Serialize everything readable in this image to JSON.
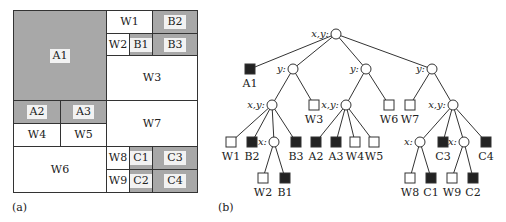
{
  "panel_a": {
    "caption": "(a)",
    "cells": [
      {
        "id": "A1",
        "label": "A1",
        "filled": true,
        "x": 13,
        "y": 10,
        "w": 94,
        "h": 91
      },
      {
        "id": "W1",
        "label": "W1",
        "filled": false,
        "x": 106,
        "y": 10,
        "w": 47,
        "h": 24
      },
      {
        "id": "B2",
        "label": "B2",
        "filled": true,
        "x": 152,
        "y": 10,
        "w": 46,
        "h": 24
      },
      {
        "id": "W2",
        "label": "W2",
        "filled": false,
        "x": 106,
        "y": 33,
        "w": 24,
        "h": 23
      },
      {
        "id": "B1",
        "label": "B1",
        "filled": true,
        "x": 129,
        "y": 33,
        "w": 24,
        "h": 23
      },
      {
        "id": "B3",
        "label": "B3",
        "filled": true,
        "x": 152,
        "y": 33,
        "w": 46,
        "h": 23
      },
      {
        "id": "W3",
        "label": "W3",
        "filled": false,
        "x": 106,
        "y": 55,
        "w": 92,
        "h": 46
      },
      {
        "id": "A2",
        "label": "A2",
        "filled": true,
        "x": 13,
        "y": 100,
        "w": 48,
        "h": 24
      },
      {
        "id": "A3",
        "label": "A3",
        "filled": true,
        "x": 60,
        "y": 100,
        "w": 47,
        "h": 24
      },
      {
        "id": "W4",
        "label": "W4",
        "filled": false,
        "x": 13,
        "y": 123,
        "w": 48,
        "h": 24
      },
      {
        "id": "W5",
        "label": "W5",
        "filled": false,
        "x": 60,
        "y": 123,
        "w": 47,
        "h": 24
      },
      {
        "id": "W7",
        "label": "W7",
        "filled": false,
        "x": 106,
        "y": 100,
        "w": 92,
        "h": 47
      },
      {
        "id": "W6",
        "label": "W6",
        "filled": false,
        "x": 13,
        "y": 146,
        "w": 94,
        "h": 47
      },
      {
        "id": "W8",
        "label": "W8",
        "filled": false,
        "x": 106,
        "y": 146,
        "w": 24,
        "h": 24
      },
      {
        "id": "C1",
        "label": "C1",
        "filled": true,
        "x": 129,
        "y": 146,
        "w": 24,
        "h": 24
      },
      {
        "id": "C3",
        "label": "C3",
        "filled": true,
        "x": 152,
        "y": 146,
        "w": 46,
        "h": 24
      },
      {
        "id": "W9",
        "label": "W9",
        "filled": false,
        "x": 106,
        "y": 169,
        "w": 24,
        "h": 24
      },
      {
        "id": "C2",
        "label": "C2",
        "filled": true,
        "x": 129,
        "y": 169,
        "w": 24,
        "h": 24
      },
      {
        "id": "C4",
        "label": "C4",
        "filled": true,
        "x": 152,
        "y": 169,
        "w": 46,
        "h": 24
      }
    ]
  },
  "panel_b": {
    "caption": "(b)",
    "nodes": [
      {
        "id": "root",
        "kind": "split",
        "label": "x,y:",
        "x": 126,
        "y": 34
      },
      {
        "id": "A1",
        "kind": "filled",
        "label": "A1",
        "x": 40,
        "y": 69
      },
      {
        "id": "y1",
        "kind": "split",
        "label": "y:",
        "x": 83,
        "y": 69
      },
      {
        "id": "y2",
        "kind": "split",
        "label": "y:",
        "x": 156,
        "y": 69
      },
      {
        "id": "y3",
        "kind": "split",
        "label": "y:",
        "x": 222,
        "y": 69
      },
      {
        "id": "xy1",
        "kind": "split",
        "label": "x,y:",
        "x": 62,
        "y": 105
      },
      {
        "id": "W3",
        "kind": "empty",
        "label": "W3",
        "x": 104,
        "y": 105
      },
      {
        "id": "xy2",
        "kind": "split",
        "label": "x,y:",
        "x": 136,
        "y": 105
      },
      {
        "id": "W6",
        "kind": "empty",
        "label": "W6",
        "x": 179,
        "y": 105
      },
      {
        "id": "W7",
        "kind": "empty",
        "label": "W7",
        "x": 200,
        "y": 105
      },
      {
        "id": "xy3",
        "kind": "split",
        "label": "x,y:",
        "x": 243,
        "y": 105
      },
      {
        "id": "W1",
        "kind": "empty",
        "label": "W1",
        "x": 21,
        "y": 142
      },
      {
        "id": "B2",
        "kind": "filled",
        "label": "B2",
        "x": 42,
        "y": 142
      },
      {
        "id": "x1",
        "kind": "split",
        "label": "x:",
        "x": 64,
        "y": 142
      },
      {
        "id": "B3",
        "kind": "filled",
        "label": "B3",
        "x": 86,
        "y": 142
      },
      {
        "id": "A2",
        "kind": "filled",
        "label": "A2",
        "x": 106,
        "y": 142
      },
      {
        "id": "A3",
        "kind": "filled",
        "label": "A3",
        "x": 126,
        "y": 142
      },
      {
        "id": "W4",
        "kind": "empty",
        "label": "W4",
        "x": 145,
        "y": 142
      },
      {
        "id": "W5",
        "kind": "empty",
        "label": "W5",
        "x": 164,
        "y": 142
      },
      {
        "id": "x2",
        "kind": "split",
        "label": "x:",
        "x": 210,
        "y": 142
      },
      {
        "id": "C3",
        "kind": "filled",
        "label": "C3",
        "x": 233,
        "y": 142
      },
      {
        "id": "x3",
        "kind": "split",
        "label": "x:",
        "x": 254,
        "y": 142
      },
      {
        "id": "C4",
        "kind": "filled",
        "label": "C4",
        "x": 276,
        "y": 142
      },
      {
        "id": "W2",
        "kind": "empty",
        "label": "W2",
        "x": 53,
        "y": 178
      },
      {
        "id": "B1",
        "kind": "filled",
        "label": "B1",
        "x": 75,
        "y": 178
      },
      {
        "id": "W8",
        "kind": "empty",
        "label": "W8",
        "x": 200,
        "y": 178
      },
      {
        "id": "C1",
        "kind": "filled",
        "label": "C1",
        "x": 221,
        "y": 178
      },
      {
        "id": "W9",
        "kind": "empty",
        "label": "W9",
        "x": 242,
        "y": 178
      },
      {
        "id": "C2",
        "kind": "filled",
        "label": "C2",
        "x": 263,
        "y": 178
      }
    ],
    "edges": [
      [
        "root",
        "A1"
      ],
      [
        "root",
        "y1"
      ],
      [
        "root",
        "y2"
      ],
      [
        "root",
        "y3"
      ],
      [
        "y1",
        "xy1"
      ],
      [
        "y1",
        "W3"
      ],
      [
        "y2",
        "xy2"
      ],
      [
        "y2",
        "W6"
      ],
      [
        "y3",
        "W7"
      ],
      [
        "y3",
        "xy3"
      ],
      [
        "xy1",
        "W1"
      ],
      [
        "xy1",
        "B2"
      ],
      [
        "xy1",
        "x1"
      ],
      [
        "xy1",
        "B3"
      ],
      [
        "xy2",
        "A2"
      ],
      [
        "xy2",
        "A3"
      ],
      [
        "xy2",
        "W4"
      ],
      [
        "xy2",
        "W5"
      ],
      [
        "xy3",
        "x2"
      ],
      [
        "xy3",
        "C3"
      ],
      [
        "xy3",
        "x3"
      ],
      [
        "xy3",
        "C4"
      ],
      [
        "x1",
        "W2"
      ],
      [
        "x1",
        "B1"
      ],
      [
        "x2",
        "W8"
      ],
      [
        "x2",
        "C1"
      ],
      [
        "x3",
        "W9"
      ],
      [
        "x3",
        "C2"
      ]
    ]
  },
  "colors": {
    "filled_region": "#a8a8a8",
    "filled_node": "#222222",
    "line": "#333333",
    "background": "#ffffff"
  }
}
